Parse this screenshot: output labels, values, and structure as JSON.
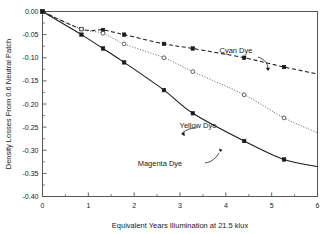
{
  "chart_data": {
    "type": "line",
    "title": "",
    "xlabel": "Equivalent Years Illumination at 21.5 klux",
    "ylabel": "Density Losses From 0.6 Neutral Patch",
    "xlim": [
      0,
      6
    ],
    "ylim": [
      -0.4,
      0.0
    ],
    "xticks": [
      0,
      1,
      2,
      3,
      4,
      5,
      6
    ],
    "xtick_labels": [
      "0",
      "1",
      "2",
      "3",
      "4",
      "5",
      "6"
    ],
    "xticks_minor": [
      0.5,
      1.5,
      2.5,
      3.5,
      4.5,
      5.5
    ],
    "yticks": [
      0.0,
      -0.05,
      -0.1,
      -0.15,
      -0.2,
      -0.25,
      -0.3,
      -0.35,
      -0.4
    ],
    "ytick_labels": [
      "0.00",
      "-0.05",
      "-0.10",
      "-0.15",
      "-0.20",
      "-0.25",
      "-0.30",
      "-0.35",
      "-0.40"
    ],
    "grid": false,
    "legend_position": "inline-annotations",
    "series": [
      {
        "name": "Cyan Dye",
        "label": "Cyan Dye",
        "linestyle": "dashed",
        "marker": "filled-square",
        "color": "#1a1a1a",
        "x": [
          0.0,
          0.85,
          1.32,
          1.78,
          2.65,
          3.28,
          4.4,
          5.27,
          6.0
        ],
        "y": [
          0.0,
          -0.038,
          -0.04,
          -0.05,
          -0.07,
          -0.08,
          -0.1,
          -0.12,
          -0.135
        ]
      },
      {
        "name": "Yellow Dye",
        "label": "Yellow Dye",
        "linestyle": "dotted",
        "marker": "open-circle",
        "color": "#4d4d4d",
        "x": [
          0.0,
          0.85,
          1.32,
          1.78,
          2.65,
          3.28,
          4.4,
          5.27,
          6.0
        ],
        "y": [
          0.0,
          -0.038,
          -0.047,
          -0.07,
          -0.1,
          -0.13,
          -0.18,
          -0.23,
          -0.262
        ]
      },
      {
        "name": "Magenta Dye",
        "label": "Magenta Dye",
        "linestyle": "solid",
        "marker": "filled-square",
        "color": "#1a1a1a",
        "x": [
          0.0,
          0.85,
          1.32,
          1.78,
          2.65,
          3.28,
          4.4,
          5.27,
          6.0
        ],
        "y": [
          0.0,
          -0.05,
          -0.08,
          -0.11,
          -0.17,
          -0.22,
          -0.28,
          -0.32,
          -0.335
        ]
      }
    ],
    "annotations": [
      {
        "text": "Cyan Dye",
        "x_px": 236,
        "y_px": 53
      },
      {
        "text": "Yellow Dye",
        "x_px": 198,
        "y_px": 128
      },
      {
        "text": "Magenta Dye",
        "x_px": 160,
        "y_px": 166
      }
    ]
  },
  "axes": {
    "x_axis_title": "Equivalent Years Illumination at 21.5 klux",
    "y_axis_title": "Density Losses From 0.6 Neutral Patch"
  },
  "colors": {
    "background": "#ffffff",
    "frame": "#555555",
    "text": "#1a1a1a",
    "cyan_series": "#1a1a1a",
    "yellow_series": "#4d4d4d",
    "magenta_series": "#1a1a1a"
  }
}
